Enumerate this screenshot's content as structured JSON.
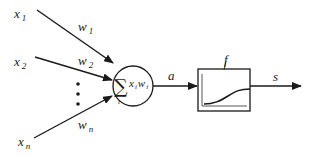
{
  "diagram": {
    "inputs": [
      {
        "name": "x",
        "sub": "1",
        "weight": "w",
        "weight_sub": "1"
      },
      {
        "name": "x",
        "sub": "2",
        "weight": "w",
        "weight_sub": "2"
      },
      {
        "name": "x",
        "sub": "n",
        "weight": "w",
        "weight_sub": "n"
      }
    ],
    "ellipsis": "⋮",
    "summation": {
      "symbol": "∑",
      "index": "i",
      "term_x": "x",
      "term_x_sub": "i",
      "term_w": "w",
      "term_w_sub": "i"
    },
    "activation_input_label": "a",
    "activation_function_label": "f",
    "output_label": "s",
    "colors": {
      "stroke": "#1a1a1a",
      "background": "#ffffff"
    }
  }
}
